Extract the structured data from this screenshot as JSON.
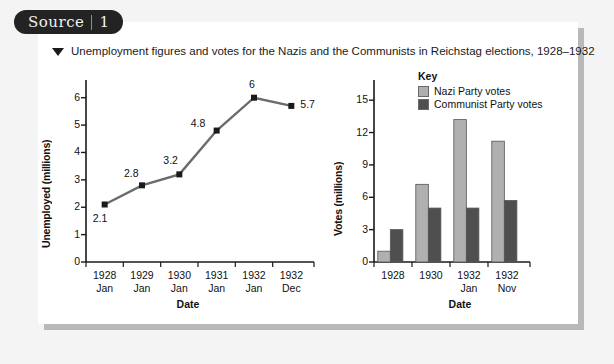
{
  "badge": {
    "label": "Source",
    "number": "1"
  },
  "caption": {
    "marker": "triangle-down",
    "text": "Unemployment figures and votes for the Nazis and the Communists in Reichstag elections, 1928–1932"
  },
  "colors": {
    "badge_bg": "#232323",
    "panel_bg": "#ffffff",
    "page_bg": "#f4f4f4",
    "line": "#6b6b6b",
    "marker": "#1a1a1a",
    "nazi_bar": "#b0b0b0",
    "communist_bar": "#4f4f4f",
    "axis": "#1a1a1a"
  },
  "chart_data": [
    {
      "type": "line",
      "id": "unemployment-line-chart",
      "title": "",
      "xlabel": "Date",
      "ylabel": "Unemployed (millions)",
      "ylim": [
        0,
        6.5
      ],
      "yticks": [
        "0",
        "1",
        "2",
        "3",
        "4",
        "5",
        "6"
      ],
      "ytick_values": [
        0,
        1,
        2,
        3,
        4,
        5,
        6
      ],
      "grid": false,
      "categories": [
        "1928 Jan",
        "1929 Jan",
        "1930 Jan",
        "1931 Jan",
        "1932 Jan",
        "1932 Dec"
      ],
      "xtick_labels": [
        {
          "year": "1928",
          "month": "Jan"
        },
        {
          "year": "1929",
          "month": "Jan"
        },
        {
          "year": "1930",
          "month": "Jan"
        },
        {
          "year": "1931",
          "month": "Jan"
        },
        {
          "year": "1932",
          "month": "Jan"
        },
        {
          "year": "1932",
          "month": "Dec"
        }
      ],
      "values": [
        2.1,
        2.8,
        3.2,
        4.8,
        6,
        5.7
      ],
      "point_labels": [
        "2.1",
        "2.8",
        "3.2",
        "4.8",
        "6",
        "5.7"
      ]
    },
    {
      "type": "bar",
      "id": "votes-bar-chart",
      "title": "",
      "xlabel": "Date",
      "ylabel": "Votes (millions)",
      "ylim": [
        0,
        16.5
      ],
      "yticks": [
        "0",
        "3",
        "6",
        "9",
        "12",
        "15"
      ],
      "ytick_values": [
        0,
        3,
        6,
        9,
        12,
        15
      ],
      "grid": false,
      "legend_title": "Key",
      "legend_position": "top-right-inside",
      "categories": [
        "1928",
        "1930",
        "1932 Jan",
        "1932 Nov"
      ],
      "xtick_labels": [
        {
          "year": "1928",
          "month": ""
        },
        {
          "year": "1930",
          "month": ""
        },
        {
          "year": "1932",
          "month": "Jan"
        },
        {
          "year": "1932",
          "month": "Nov"
        }
      ],
      "series": [
        {
          "name": "Nazi Party votes",
          "values": [
            1.0,
            7.2,
            13.2,
            11.2
          ],
          "color": "#b0b0b0"
        },
        {
          "name": "Communist Party votes",
          "values": [
            3.0,
            5.0,
            5.0,
            5.7
          ],
          "color": "#4f4f4f"
        }
      ]
    }
  ]
}
